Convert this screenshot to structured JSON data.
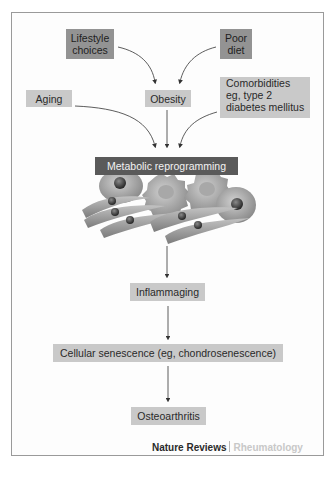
{
  "figure": {
    "factors": {
      "lifestyle": "Lifestyle choices",
      "lifestyle_line1": "Lifestyle",
      "lifestyle_line2": "choices",
      "poor_diet_line1": "Poor",
      "poor_diet_line2": "diet",
      "aging": "Aging",
      "obesity": "Obesity",
      "comorbidities_line1": "Comorbidities",
      "comorbidities_line2": "eg, type 2",
      "comorbidities_line3": "diabetes mellitus"
    },
    "process": {
      "metabolic": "Metabolic reprogramming",
      "inflammaging": "Inflammaging",
      "senescence": "Cellular senescence (eg, chondrosenescence)",
      "outcome": "Osteoarthritis"
    },
    "footer": {
      "brand": "Nature Reviews",
      "journal": "Rheumatology"
    },
    "colors": {
      "light_box": "#c9c9c9",
      "dark_box": "#939393",
      "metabolic_bar": "#5a5a5a",
      "arrow": "#333333"
    }
  }
}
